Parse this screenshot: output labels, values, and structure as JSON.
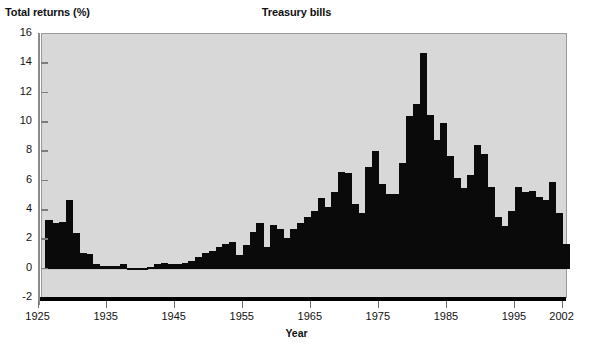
{
  "chart_data": {
    "type": "bar",
    "title": "Treasury bills",
    "xlabel": "Year",
    "ylabel": "Total returns (%)",
    "ylim": [
      -2,
      16
    ],
    "yticks": [
      -2,
      0,
      2,
      4,
      6,
      8,
      10,
      12,
      14,
      16
    ],
    "xlim": [
      1925,
      2002
    ],
    "xticks": [
      1925,
      1935,
      1945,
      1955,
      1965,
      1975,
      1985,
      1995,
      2002
    ],
    "grid": false,
    "legend": null,
    "bar_color": "#0a0a0a",
    "plot_background": "#d8d8d8",
    "categories": [
      1926,
      1927,
      1928,
      1929,
      1930,
      1931,
      1932,
      1933,
      1934,
      1935,
      1936,
      1937,
      1938,
      1939,
      1940,
      1941,
      1942,
      1943,
      1944,
      1945,
      1946,
      1947,
      1948,
      1949,
      1950,
      1951,
      1952,
      1953,
      1954,
      1955,
      1956,
      1957,
      1958,
      1959,
      1960,
      1961,
      1962,
      1963,
      1964,
      1965,
      1966,
      1967,
      1968,
      1969,
      1970,
      1971,
      1972,
      1973,
      1974,
      1975,
      1976,
      1977,
      1978,
      1979,
      1980,
      1981,
      1982,
      1983,
      1984,
      1985,
      1986,
      1987,
      1988,
      1989,
      1990,
      1991,
      1992,
      1993,
      1994,
      1995,
      1996,
      1997,
      1998,
      1999,
      2000,
      2001,
      2002
    ],
    "values": [
      3.3,
      3.1,
      3.2,
      4.7,
      2.4,
      1.1,
      1.0,
      0.3,
      0.2,
      0.2,
      0.2,
      0.3,
      0.0,
      0.0,
      0.0,
      0.1,
      0.3,
      0.4,
      0.3,
      0.3,
      0.4,
      0.5,
      0.8,
      1.1,
      1.2,
      1.5,
      1.7,
      1.8,
      0.9,
      1.6,
      2.5,
      3.1,
      1.5,
      3.0,
      2.7,
      2.1,
      2.7,
      3.1,
      3.5,
      3.9,
      4.8,
      4.2,
      5.2,
      6.6,
      6.5,
      4.4,
      3.8,
      6.9,
      8.0,
      5.8,
      5.1,
      5.1,
      7.2,
      10.4,
      11.2,
      14.7,
      10.5,
      8.8,
      9.9,
      7.7,
      6.2,
      5.5,
      6.4,
      8.4,
      7.8,
      5.6,
      3.5,
      2.9,
      3.9,
      5.6,
      5.2,
      5.3,
      4.9,
      4.7,
      5.9,
      3.8,
      1.7
    ]
  },
  "axis": {
    "ytick_labels": [
      "16",
      "14",
      "12",
      "10",
      "8",
      "6",
      "4",
      "2",
      "0",
      "-2"
    ],
    "xtick_labels": [
      "1925",
      "1935",
      "1945",
      "1955",
      "1965",
      "1975",
      "1985",
      "1995",
      "2002"
    ]
  }
}
